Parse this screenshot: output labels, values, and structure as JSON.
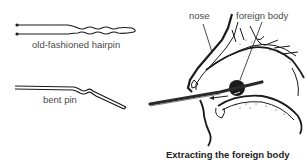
{
  "labels": {
    "hairpin": "old-fashioned hairpin",
    "bent_pin": "bent pin",
    "nose": "nose",
    "foreign_body": "foreign body"
  },
  "caption": "Extracting the foreign body",
  "colors": {
    "line": "#1a1a1a",
    "text": "#4a4a4a",
    "caption": "#222222",
    "background": "#ffffff"
  }
}
